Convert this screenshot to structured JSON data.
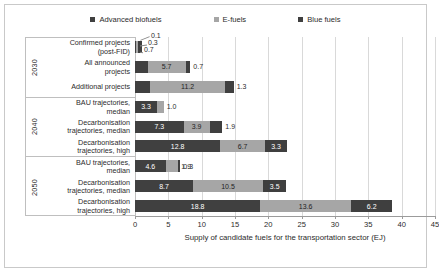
{
  "chart_data": {
    "type": "bar",
    "orientation": "horizontal",
    "stacked": true,
    "title": "",
    "xlabel": "Supply of candidate fuels for the transportation sector (EJ)",
    "ylabel": "",
    "xlim": [
      0,
      45
    ],
    "xticks": [
      0,
      5,
      10,
      15,
      20,
      25,
      30,
      35,
      40,
      45
    ],
    "grid": true,
    "legend_position": "top",
    "series": [
      {
        "name": "Advanced biofuels",
        "color": "#404040",
        "values": [
          0.1,
          1.9,
          2.3,
          3.3,
          7.3,
          12.8,
          4.6,
          8.7,
          18.8
        ]
      },
      {
        "name": "E-fuels",
        "color": "#a6a6a6",
        "values": [
          0.3,
          5.7,
          11.2,
          1.0,
          3.9,
          6.7,
          1.9,
          10.5,
          13.6
        ]
      },
      {
        "name": "Blue fuels",
        "color": "#3f3f3f",
        "values": [
          0.7,
          0.7,
          1.3,
          0.0,
          1.9,
          3.3,
          0.3,
          3.5,
          6.2
        ]
      }
    ],
    "categories": [
      "Confirmed projects (post-FID)",
      "All announced projects",
      "Additional projects",
      "BAU trajectories, median",
      "Decarbonisation trajectories, median",
      "Decarbonisation trajectories, high",
      "BAU trajectories, median",
      "Decarbonisation trajectories, median",
      "Decarbonisation trajectories, high"
    ],
    "groups": [
      {
        "label": "2030",
        "rows": 3
      },
      {
        "label": "2040",
        "rows": 3
      },
      {
        "label": "2050",
        "rows": 3
      }
    ]
  },
  "legend": {
    "items": [
      {
        "label": "Advanced biofuels",
        "color": "#404040"
      },
      {
        "label": "E-fuels",
        "color": "#a6a6a6"
      },
      {
        "label": "Blue fuels",
        "color": "#3f3f3f"
      }
    ]
  },
  "categories": [
    {
      "line1": "Confirmed projects",
      "line2": "(post-FID)"
    },
    {
      "line1": "All announced",
      "line2": "projects"
    },
    {
      "line1": "Additional projects",
      "line2": ""
    },
    {
      "line1": "BAU trajectories,",
      "line2": "median"
    },
    {
      "line1": "Decarbonisation",
      "line2": "trajectories, median"
    },
    {
      "line1": "Decarbonisation",
      "line2": "trajectories, high"
    },
    {
      "line1": "BAU trajectories,",
      "line2": "median"
    },
    {
      "line1": "Decarbonisation",
      "line2": "trajectories, median"
    },
    {
      "line1": "Decarbonisation",
      "line2": "trajectories, high"
    }
  ],
  "groups": [
    {
      "label": "2030"
    },
    {
      "label": "2040"
    },
    {
      "label": "2050"
    }
  ],
  "rows": [
    {
      "labels": [
        "0.1",
        "0.3",
        "0.7"
      ],
      "callout": true
    },
    {
      "labels": [
        "1.9",
        "5.7",
        "0.7"
      ],
      "callout": false
    },
    {
      "labels": [
        "2.3",
        "11.2",
        "1.3"
      ],
      "callout": false
    },
    {
      "labels": [
        "3.3",
        "1.0",
        ""
      ],
      "callout": false
    },
    {
      "labels": [
        "7.3",
        "3.9",
        "1.9"
      ],
      "callout": false
    },
    {
      "labels": [
        "12.8",
        "6.7",
        "3.3"
      ],
      "callout": false
    },
    {
      "labels": [
        "4.6",
        "1.9",
        "0.3"
      ],
      "callout": false
    },
    {
      "labels": [
        "8.7",
        "10.5",
        "3.5"
      ],
      "callout": false
    },
    {
      "labels": [
        "18.8",
        "13.6",
        "6.2"
      ],
      "callout": false
    }
  ],
  "axis": {
    "ticklabels": [
      "0",
      "5",
      "10",
      "15",
      "20",
      "25",
      "30",
      "35",
      "40",
      "45"
    ],
    "title": "Supply of candidate fuels for the transportation sector (EJ)"
  }
}
